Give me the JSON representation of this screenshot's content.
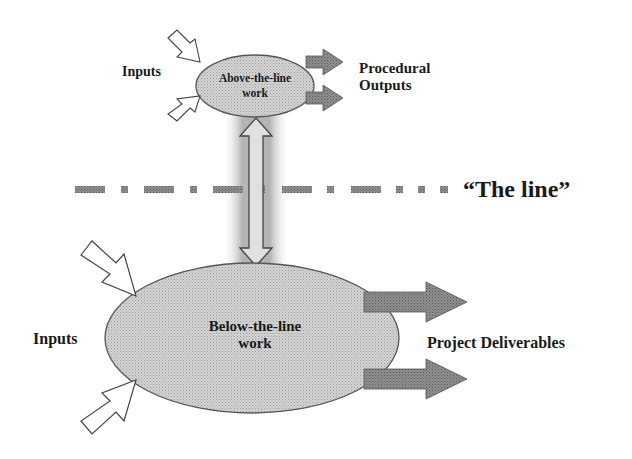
{
  "diagram": {
    "top_node": {
      "label_line1": "Above-the-line",
      "label_line2": "work",
      "inputs_label": "Inputs",
      "outputs_label_line1": "Procedural",
      "outputs_label_line2": "Outputs"
    },
    "divider": {
      "label": "“The line”"
    },
    "bottom_node": {
      "label_line1": "Below-the-line",
      "label_line2": "work",
      "inputs_label": "Inputs",
      "outputs_label": "Project Deliverables"
    },
    "colors": {
      "ellipse_fill": "#c8c8c8",
      "ellipse_stroke": "#555555",
      "output_arrow_fill": "#8a8a8a",
      "input_arrow_fill": "#ffffff",
      "glow": "#9a9a9a",
      "text": "#1a1a1a"
    }
  }
}
